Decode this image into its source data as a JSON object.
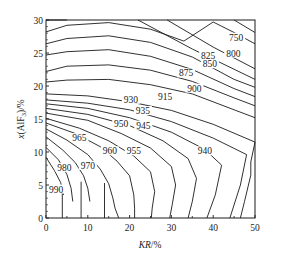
{
  "chart_data": {
    "type": "contour",
    "title": "",
    "xlabel": "KR/%",
    "ylabel": "x(AlF3)/%",
    "ylabel_display": [
      "x(AlF",
      "3",
      ")/%"
    ],
    "xlim": [
      0,
      50
    ],
    "ylim": [
      0,
      30
    ],
    "x_ticks": [
      0,
      10,
      20,
      30,
      40,
      50
    ],
    "y_ticks": [
      0,
      5,
      10,
      15,
      20,
      25,
      30
    ],
    "grid": false,
    "legend": null,
    "level_labels": [
      {
        "level": "750",
        "x": 45.5,
        "y": 27.0
      },
      {
        "level": "800",
        "x": 44.8,
        "y": 24.6
      },
      {
        "level": "825",
        "x": 38.8,
        "y": 24.3
      },
      {
        "level": "850",
        "x": 39.2,
        "y": 23.0
      },
      {
        "level": "875",
        "x": 33.5,
        "y": 21.6
      },
      {
        "level": "900",
        "x": 35.5,
        "y": 19.3
      },
      {
        "level": "915",
        "x": 28.5,
        "y": 18.0
      },
      {
        "level": "930",
        "x": 20.3,
        "y": 17.6
      },
      {
        "level": "935",
        "x": 23.2,
        "y": 15.9
      },
      {
        "level": "945",
        "x": 23.3,
        "y": 13.7
      },
      {
        "level": "950",
        "x": 18.0,
        "y": 13.9
      },
      {
        "level": "955",
        "x": 21.0,
        "y": 9.8
      },
      {
        "level": "960",
        "x": 15.3,
        "y": 9.8
      },
      {
        "level": "965",
        "x": 8.0,
        "y": 11.8
      },
      {
        "level": "970",
        "x": 10.0,
        "y": 7.6
      },
      {
        "level": "980",
        "x": 4.4,
        "y": 7.3
      },
      {
        "level": "940",
        "x": 38.0,
        "y": 9.8
      },
      {
        "level": "990",
        "x": 2.4,
        "y": 4.0
      }
    ],
    "contours": [
      {
        "points": [
          [
            0,
            30
          ],
          [
            5,
            30.3
          ]
        ]
      },
      {
        "points": [
          [
            0,
            28.2
          ],
          [
            5,
            29.2
          ],
          [
            15,
            29.6
          ],
          [
            25,
            28.6
          ],
          [
            33,
            26.8
          ],
          [
            40,
            29.7
          ]
        ]
      },
      {
        "points": [
          [
            0,
            26.4
          ],
          [
            5,
            27.2
          ],
          [
            15,
            27.6
          ],
          [
            25,
            26.6
          ],
          [
            35,
            24.4
          ],
          [
            45,
            21.0
          ],
          [
            50,
            19.8
          ]
        ]
      },
      {
        "points": [
          [
            0,
            24.7
          ],
          [
            5,
            25.2
          ],
          [
            15,
            25.5
          ],
          [
            25,
            24.5
          ],
          [
            35,
            22.5
          ],
          [
            45,
            19.6
          ],
          [
            50,
            18.4
          ]
        ]
      },
      {
        "points": [
          [
            0,
            22.2
          ],
          [
            5,
            23.0
          ],
          [
            15,
            23.2
          ],
          [
            25,
            22.4
          ],
          [
            35,
            20.7
          ],
          [
            45,
            18.2
          ],
          [
            50,
            17.0
          ]
        ]
      },
      {
        "points": [
          [
            0,
            20.6
          ],
          [
            5,
            20.9
          ],
          [
            15,
            21.0
          ],
          [
            25,
            20.2
          ],
          [
            35,
            18.8
          ],
          [
            45,
            16.4
          ],
          [
            50,
            15.2
          ]
        ]
      },
      {
        "points": [
          [
            0,
            18.8
          ],
          [
            10,
            18.5
          ],
          [
            20,
            17.6
          ],
          [
            30,
            16.3
          ],
          [
            40,
            14.2
          ],
          [
            50,
            11.5
          ]
        ]
      },
      {
        "points": [
          [
            0,
            17.9
          ],
          [
            10,
            17.4
          ],
          [
            20,
            16.4
          ],
          [
            30,
            14.6
          ],
          [
            40,
            12.1
          ],
          [
            48,
            9.6
          ]
        ]
      },
      {
        "points": [
          [
            0,
            17.3
          ],
          [
            10,
            16.6
          ],
          [
            20,
            15.2
          ],
          [
            30,
            13.0
          ],
          [
            38,
            10.4
          ],
          [
            42,
            8.0
          ]
        ]
      },
      {
        "points": [
          [
            0,
            16.6
          ],
          [
            10,
            15.7
          ],
          [
            20,
            14.0
          ],
          [
            28,
            11.7
          ],
          [
            34,
            9.0
          ],
          [
            36,
            6.0
          ]
        ]
      },
      {
        "points": [
          [
            0,
            15.9
          ],
          [
            10,
            14.8
          ],
          [
            18,
            12.8
          ],
          [
            25,
            10.6
          ],
          [
            30,
            7.8
          ],
          [
            31,
            5.0
          ]
        ]
      },
      {
        "points": [
          [
            0,
            15.1
          ],
          [
            8,
            13.6
          ],
          [
            15,
            11.7
          ],
          [
            21,
            9.4
          ],
          [
            25,
            7.0
          ],
          [
            26,
            4.0
          ]
        ]
      },
      {
        "points": [
          [
            0,
            14.4
          ],
          [
            7,
            12.8
          ],
          [
            13,
            10.8
          ],
          [
            17,
            8.6
          ],
          [
            20,
            6.4
          ],
          [
            21,
            3.5
          ]
        ]
      },
      {
        "points": [
          [
            0,
            13.5
          ],
          [
            5,
            11.8
          ],
          [
            10,
            9.6
          ],
          [
            13,
            7.4
          ],
          [
            15,
            5.2
          ],
          [
            16,
            3.0
          ]
        ]
      },
      {
        "points": [
          [
            0,
            12.3
          ],
          [
            4,
            10.3
          ],
          [
            7,
            8.4
          ],
          [
            9,
            6.4
          ],
          [
            10,
            4.5
          ],
          [
            10.5,
            2.5
          ]
        ]
      },
      {
        "points": [
          [
            0,
            10.7
          ],
          [
            3,
            8.8
          ],
          [
            5,
            6.6
          ],
          [
            6,
            4.5
          ],
          [
            6.4,
            2.5
          ]
        ]
      },
      {
        "points": [
          [
            0,
            9.2
          ],
          [
            2,
            7.2
          ],
          [
            3.5,
            5.4
          ],
          [
            4.2,
            3.5
          ]
        ]
      },
      {
        "points": [
          [
            3.9,
            5.0
          ],
          [
            3.9,
            0
          ]
        ]
      },
      {
        "points": [
          [
            8.4,
            5.5
          ],
          [
            8.4,
            0
          ]
        ]
      },
      {
        "points": [
          [
            14.0,
            5.3
          ],
          [
            14.0,
            0
          ]
        ]
      },
      {
        "points": [
          [
            16,
            3.0
          ],
          [
            16.5,
            1.5
          ],
          [
            17.4,
            0
          ]
        ]
      },
      {
        "points": [
          [
            21,
            3.5
          ],
          [
            21.2,
            1.5
          ],
          [
            21.2,
            0
          ]
        ]
      },
      {
        "points": [
          [
            26,
            4.0
          ],
          [
            25.4,
            1.5
          ],
          [
            25.2,
            0
          ]
        ]
      },
      {
        "points": [
          [
            31,
            5.0
          ],
          [
            30.2,
            2.0
          ],
          [
            29.6,
            0
          ]
        ]
      },
      {
        "points": [
          [
            36,
            6.0
          ],
          [
            35.0,
            2.5
          ],
          [
            34.0,
            0
          ]
        ]
      },
      {
        "points": [
          [
            42,
            8.0
          ],
          [
            40.5,
            3.5
          ],
          [
            38.5,
            0
          ]
        ]
      },
      {
        "points": [
          [
            48,
            9.6
          ],
          [
            46.5,
            5.0
          ],
          [
            44.0,
            0
          ]
        ]
      },
      {
        "points": [
          [
            50,
            11.5
          ],
          [
            49,
            8.5
          ],
          [
            49,
            6.5
          ],
          [
            47.5,
            2.5
          ],
          [
            46.5,
            0
          ]
        ]
      },
      {
        "points": [
          [
            40,
            29.7
          ],
          [
            45,
            28.1
          ],
          [
            50,
            26.4
          ]
        ]
      },
      {
        "points": [
          [
            45,
            30
          ],
          [
            50,
            28.1
          ]
        ]
      },
      {
        "points": [
          [
            29,
            30
          ],
          [
            40,
            25.9
          ],
          [
            50,
            22.6
          ]
        ]
      },
      {
        "points": [
          [
            22,
            30
          ],
          [
            35,
            25.6
          ],
          [
            50,
            21.0
          ]
        ]
      }
    ]
  }
}
